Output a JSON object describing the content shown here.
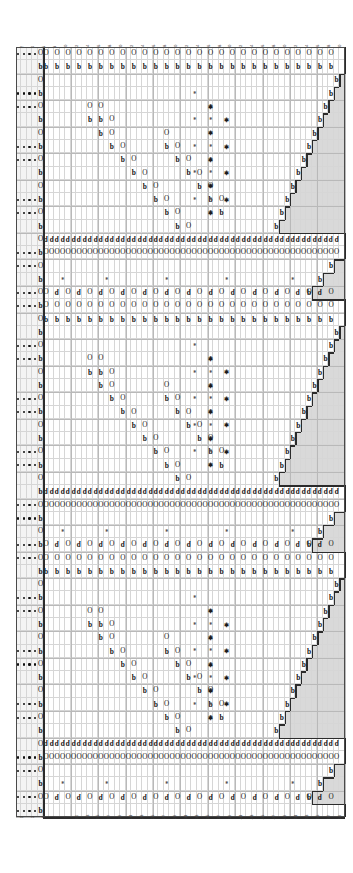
{
  "chart": {
    "title_visible": false,
    "type": "knitting-lace-chart",
    "grid": {
      "columns": 60,
      "rows": 58,
      "cell_w": 5.48,
      "cell_h": 13.28,
      "major_every_col": 5,
      "major_every_row": 2
    },
    "colors": {
      "grid_minor": "#d6d6d6",
      "grid_major": "#b9b9b9",
      "no_stitch": "#d9d9d9",
      "edge_band": "#f4f4f4",
      "outline": "#2b2b2b",
      "symbol": "#151515"
    },
    "column_labels_top": [
      "2",
      "4",
      "6",
      "8",
      "10",
      "12",
      "14",
      "16",
      "18",
      "20",
      "22",
      "24",
      "26",
      "28",
      "30",
      "32",
      "34",
      "36",
      "38",
      "40",
      "42",
      "44",
      "46",
      "48",
      "50",
      "52",
      "54",
      "56",
      "58",
      "60"
    ],
    "column_labels_bottom": [
      "1",
      "3",
      "5",
      "7",
      "9",
      "11",
      "13",
      "15",
      "17",
      "19",
      "21",
      "23",
      "25",
      "27",
      "29",
      "31",
      "33",
      "35",
      "37",
      "39",
      "41",
      "43",
      "45",
      "47",
      "49",
      "51",
      "53",
      "55",
      "57",
      "59"
    ],
    "legend": {
      "yarn_over": "O",
      "decrease_left": "k2tog",
      "decrease_right": "ssk",
      "nupp": "*",
      "purl": "dot",
      "no_stitch": "grey cell"
    },
    "edge_band_columns": 5,
    "repeats": 3,
    "rows_per_repeat": 19
  }
}
